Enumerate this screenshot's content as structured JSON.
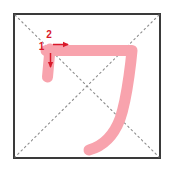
{
  "diagram": {
    "type": "stroke-order",
    "character": "刀",
    "stroke_count": 2,
    "canvas": {
      "width": 174,
      "height": 169
    },
    "grid": {
      "box": {
        "x": 14,
        "y": 14,
        "width": 146,
        "height": 144
      },
      "border_color": "#3a3a3a",
      "border_width": 2,
      "background": "#ffffff",
      "guides": [
        {
          "name": "diagonal-tl-br",
          "x1": 15,
          "y1": 15,
          "x2": 159,
          "y2": 157
        },
        {
          "name": "diagonal-tr-bl",
          "x1": 159,
          "y1": 15,
          "x2": 15,
          "y2": 157
        }
      ],
      "guide_color": "#8d8d8d",
      "guide_dash": "1.6 3.2",
      "guide_width": 1.1
    },
    "stroke_color": "#f8a3ad",
    "stroke_width": 11,
    "strokes": [
      {
        "order": 1,
        "name": "stroke-1-vertical-short",
        "label": "1",
        "label_x": 41.5,
        "label_y": 50,
        "path": "M 50 49 L 47.5 77",
        "arrow": {
          "name": "arrow-down",
          "x1": 50.5,
          "y1": 53,
          "x2": 50.5,
          "y2": 67,
          "direction": "down"
        }
      },
      {
        "order": 2,
        "name": "stroke-2-horizontal-turn-sweep",
        "label": "2",
        "label_x": 49,
        "label_y": 38,
        "path": "M 46 50.5 L 132 50.5 C 132 50.5 128 96 120 119 C 112 140 100 147 89 150",
        "arrow": {
          "name": "arrow-right",
          "x1": 53,
          "y1": 44.5,
          "x2": 68,
          "y2": 44.5,
          "direction": "right"
        }
      }
    ],
    "annotation_color": "#d9192a",
    "annotation_font_size": 10
  }
}
